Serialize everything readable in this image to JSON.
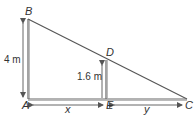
{
  "diagram": {
    "type": "similar-triangles",
    "points": {
      "A": {
        "label": "A"
      },
      "B": {
        "label": "B"
      },
      "C": {
        "label": "C"
      },
      "D": {
        "label": "D"
      },
      "E": {
        "label": "E"
      }
    },
    "measurements": {
      "AB": "4 m",
      "ED": "1.6 m",
      "AE": "x",
      "EC": "y"
    },
    "colors": {
      "line": "#555555",
      "text": "#333333",
      "background": "#ffffff"
    }
  }
}
